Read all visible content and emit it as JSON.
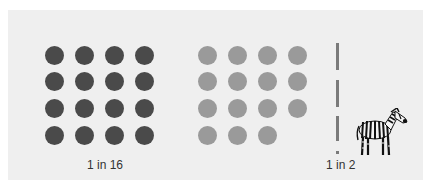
{
  "colors": {
    "background": "#ffffff",
    "panel": "#efefef",
    "dark_dot": "#4a4a4a",
    "light_dot": "#9a9a9a",
    "dash": "#7a7a7a"
  },
  "left_group": {
    "label": "1 in 16",
    "rows": 4,
    "cols": 4,
    "count": 16
  },
  "middle_group": {
    "rows": 4,
    "cols": 4,
    "count": 15,
    "note": "last cell empty"
  },
  "right_group": {
    "label": "1 in 2",
    "icon": "zebra-icon"
  }
}
